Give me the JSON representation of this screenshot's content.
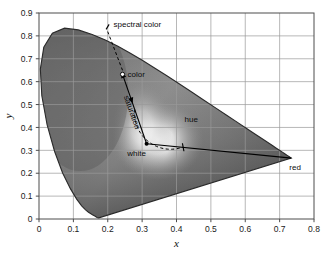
{
  "chart_data": {
    "type": "scatter",
    "title": "",
    "subtitle": "",
    "xlabel": "x",
    "ylabel": "y",
    "xlim": [
      0,
      0.8
    ],
    "ylim": [
      0,
      0.9
    ],
    "grid": true,
    "legend_position": "none",
    "rendering": "grayscale CIE 1931 chromaticity diagram",
    "xticks": [
      "0",
      "0.1",
      "0.2",
      "0.3",
      "0.4",
      "0.5",
      "0.6",
      "0.7",
      "0.8"
    ],
    "xtick_values": [
      0,
      0.1,
      0.2,
      0.3,
      0.4,
      0.5,
      0.6,
      0.7,
      0.8
    ],
    "yticks": [
      "0",
      "0.1",
      "0.2",
      "0.3",
      "0.4",
      "0.5",
      "0.6",
      "0.7",
      "0.8",
      "0.9"
    ],
    "ytick_values": [
      0,
      0.1,
      0.2,
      0.3,
      0.4,
      0.5,
      0.6,
      0.7,
      0.8,
      0.9
    ],
    "spectral_locus": [
      [
        0.1741,
        0.005
      ],
      [
        0.174,
        0.005
      ],
      [
        0.1738,
        0.0049
      ],
      [
        0.1736,
        0.0049
      ],
      [
        0.1733,
        0.0048
      ],
      [
        0.173,
        0.0048
      ],
      [
        0.1726,
        0.0048
      ],
      [
        0.1721,
        0.0048
      ],
      [
        0.1714,
        0.0051
      ],
      [
        0.1703,
        0.0058
      ],
      [
        0.1689,
        0.0069
      ],
      [
        0.1669,
        0.0086
      ],
      [
        0.1644,
        0.0109
      ],
      [
        0.1611,
        0.0138
      ],
      [
        0.1566,
        0.0177
      ],
      [
        0.151,
        0.0227
      ],
      [
        0.144,
        0.0297
      ],
      [
        0.1355,
        0.0399
      ],
      [
        0.1241,
        0.0578
      ],
      [
        0.1096,
        0.0868
      ],
      [
        0.0913,
        0.1327
      ],
      [
        0.0687,
        0.2007
      ],
      [
        0.0454,
        0.295
      ],
      [
        0.0235,
        0.4127
      ],
      [
        0.0082,
        0.5384
      ],
      [
        0.0039,
        0.6548
      ],
      [
        0.0139,
        0.7502
      ],
      [
        0.0389,
        0.812
      ],
      [
        0.0743,
        0.8338
      ],
      [
        0.1142,
        0.8262
      ],
      [
        0.1547,
        0.8059
      ],
      [
        0.1929,
        0.7816
      ],
      [
        0.2296,
        0.7543
      ],
      [
        0.2658,
        0.7243
      ],
      [
        0.3016,
        0.6923
      ],
      [
        0.3373,
        0.6589
      ],
      [
        0.3731,
        0.6245
      ],
      [
        0.4087,
        0.5896
      ],
      [
        0.4441,
        0.5547
      ],
      [
        0.4788,
        0.5202
      ],
      [
        0.5125,
        0.4866
      ],
      [
        0.5448,
        0.4544
      ],
      [
        0.5752,
        0.4242
      ],
      [
        0.6029,
        0.3965
      ],
      [
        0.627,
        0.3725
      ],
      [
        0.6482,
        0.3514
      ],
      [
        0.6658,
        0.334
      ],
      [
        0.6801,
        0.3197
      ],
      [
        0.6915,
        0.3083
      ],
      [
        0.7006,
        0.2993
      ],
      [
        0.7079,
        0.292
      ],
      [
        0.714,
        0.2859
      ],
      [
        0.719,
        0.2809
      ],
      [
        0.723,
        0.277
      ],
      [
        0.726,
        0.274
      ],
      [
        0.7283,
        0.2717
      ],
      [
        0.73,
        0.27
      ],
      [
        0.7311,
        0.2689
      ],
      [
        0.732,
        0.268
      ],
      [
        0.7327,
        0.2673
      ],
      [
        0.7334,
        0.2666
      ],
      [
        0.734,
        0.266
      ]
    ],
    "points": [
      {
        "name": "white",
        "x": 0.313,
        "y": 0.329,
        "marker": "dot",
        "label": "white"
      },
      {
        "name": "color",
        "x": 0.243,
        "y": 0.632,
        "marker": "ring",
        "label": "color"
      },
      {
        "name": "spectral color",
        "x": 0.2,
        "y": 0.79,
        "marker": "none",
        "label": "spectral color"
      },
      {
        "name": "red",
        "x": 0.734,
        "y": 0.266,
        "marker": "none",
        "label": "red"
      }
    ],
    "annotations": [
      {
        "name": "spectral color",
        "label": "spectral color",
        "type": "leader-tick"
      },
      {
        "name": "color",
        "label": "color",
        "type": "point-ring"
      },
      {
        "name": "saturation",
        "label": "saturation",
        "type": "arrow-along-line"
      },
      {
        "name": "hue",
        "label": "hue",
        "type": "dashed-arc"
      },
      {
        "name": "white",
        "label": "white",
        "type": "point-dot"
      },
      {
        "name": "red",
        "label": "red",
        "type": "vertex-label"
      }
    ]
  },
  "axes": {
    "x_title": "x",
    "y_title": "y"
  },
  "annotations": {
    "spectral_color": "spectral color",
    "color": "color",
    "saturation": "saturation",
    "hue": "hue",
    "white": "white",
    "red": "red"
  },
  "colors": {
    "frame": "#4d4d4d",
    "grid": "#9a9a9a",
    "gamut_outline": "#2b2b2b",
    "annotation": "#000000",
    "background": "#ffffff"
  }
}
